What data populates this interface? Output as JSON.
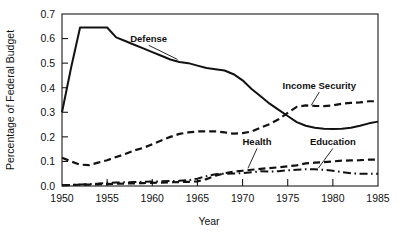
{
  "chart_data": {
    "type": "line",
    "title": "",
    "xlabel": "Year",
    "ylabel": "Percentage of Federal Budget",
    "xlim": [
      1950,
      1985
    ],
    "ylim": [
      0.0,
      0.7
    ],
    "grid": false,
    "legend_position": "inline-annotations",
    "xticks": [
      1950,
      1955,
      1960,
      1965,
      1970,
      1975,
      1980,
      1985
    ],
    "xticklabels": [
      "1950",
      "1955",
      "1960",
      "1965",
      "1970",
      "1975",
      "1980",
      "1985"
    ],
    "yticks": [
      0.0,
      0.1,
      0.2,
      0.3,
      0.4,
      0.5,
      0.6,
      0.7
    ],
    "yticklabels": [
      "0.0",
      "0.1",
      "0.2",
      "0.3",
      "0.4",
      "0.5",
      "0.6",
      "0.7"
    ],
    "x": [
      1950,
      1951,
      1952,
      1953,
      1954,
      1955,
      1956,
      1957,
      1958,
      1959,
      1960,
      1961,
      1962,
      1963,
      1964,
      1965,
      1966,
      1967,
      1968,
      1969,
      1970,
      1971,
      1972,
      1973,
      1974,
      1975,
      1976,
      1977,
      1978,
      1979,
      1980,
      1981,
      1982,
      1983,
      1984,
      1985
    ],
    "series": [
      {
        "name": "Defense",
        "style": "solid",
        "label_text": "Defense",
        "values": [
          0.3,
          0.48,
          0.645,
          0.645,
          0.645,
          0.645,
          0.605,
          0.59,
          0.575,
          0.56,
          0.545,
          0.53,
          0.515,
          0.505,
          0.5,
          0.49,
          0.48,
          0.475,
          0.47,
          0.455,
          0.43,
          0.395,
          0.365,
          0.335,
          0.31,
          0.285,
          0.26,
          0.245,
          0.237,
          0.233,
          0.232,
          0.233,
          0.237,
          0.245,
          0.255,
          0.262
        ]
      },
      {
        "name": "Income Security",
        "style": "dashed",
        "label_text": "Income Security",
        "values": [
          0.115,
          0.1,
          0.087,
          0.085,
          0.095,
          0.105,
          0.118,
          0.13,
          0.145,
          0.155,
          0.17,
          0.185,
          0.2,
          0.212,
          0.218,
          0.222,
          0.222,
          0.222,
          0.218,
          0.213,
          0.215,
          0.222,
          0.238,
          0.252,
          0.272,
          0.298,
          0.322,
          0.328,
          0.326,
          0.325,
          0.328,
          0.335,
          0.338,
          0.34,
          0.345,
          0.345
        ]
      },
      {
        "name": "Health",
        "style": "dashed",
        "label_text": "Health",
        "values": [
          0.003,
          0.004,
          0.005,
          0.006,
          0.007,
          0.008,
          0.009,
          0.01,
          0.011,
          0.012,
          0.013,
          0.014,
          0.015,
          0.016,
          0.017,
          0.019,
          0.028,
          0.042,
          0.052,
          0.058,
          0.062,
          0.066,
          0.07,
          0.073,
          0.076,
          0.08,
          0.084,
          0.092,
          0.095,
          0.097,
          0.1,
          0.103,
          0.104,
          0.105,
          0.107,
          0.108
        ]
      },
      {
        "name": "Education",
        "style": "dashdot",
        "label_text": "Education",
        "values": [
          0.003,
          0.004,
          0.006,
          0.008,
          0.01,
          0.013,
          0.014,
          0.015,
          0.016,
          0.017,
          0.018,
          0.019,
          0.02,
          0.021,
          0.024,
          0.03,
          0.04,
          0.048,
          0.05,
          0.051,
          0.052,
          0.056,
          0.06,
          0.059,
          0.06,
          0.064,
          0.066,
          0.068,
          0.068,
          0.066,
          0.062,
          0.057,
          0.052,
          0.05,
          0.05,
          0.05
        ]
      }
    ],
    "annotations": [
      {
        "text": "Defense",
        "x": 1959.6,
        "y": 0.585,
        "leader_to_x": 1962.8,
        "leader_to_y": 0.515
      },
      {
        "text": "Income Security",
        "x": 1978.5,
        "y": 0.395,
        "leader_to_x": 1977.6,
        "leader_to_y": 0.328
      },
      {
        "text": "Health",
        "x": 1971.6,
        "y": 0.165,
        "leader_to_x": 1970.6,
        "leader_to_y": 0.072
      },
      {
        "text": "Education",
        "x": 1980.0,
        "y": 0.165,
        "leader_to_x": 1978.4,
        "leader_to_y": 0.073
      }
    ],
    "colors": {
      "line": "#121212",
      "axis": "#1a1a1a",
      "background": "#ffffff",
      "text": "#111111"
    }
  }
}
